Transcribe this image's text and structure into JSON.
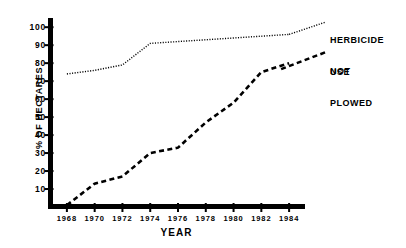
{
  "chart_data": {
    "type": "line",
    "title": "",
    "xlabel": "YEAR",
    "ylabel": "% OF HECTARES",
    "xlim": [
      1967,
      1985
    ],
    "ylim": [
      0,
      104
    ],
    "grid": false,
    "legend_position": "right",
    "x": [
      1968,
      1970,
      1972,
      1974,
      1976,
      1978,
      1980,
      1982,
      1984
    ],
    "xticklabels": [
      "1968",
      "1970",
      "1972",
      "1974",
      "1976",
      "1978",
      "1980",
      "1982",
      "1984"
    ],
    "yticks": [
      10,
      20,
      30,
      40,
      50,
      60,
      70,
      80,
      90,
      100
    ],
    "yticklabels": [
      "10",
      "20",
      "30",
      "40",
      "50",
      "60",
      "70",
      "80",
      "90",
      "100"
    ],
    "series": [
      {
        "name": "HERBICIDE USE",
        "label_lines": [
          "HERBICIDE",
          "USE"
        ],
        "linestyle": "dotted",
        "color": "#000000",
        "values": [
          74,
          76,
          79,
          91,
          92,
          93,
          94,
          95,
          96
        ]
      },
      {
        "name": "NOT PLOWED",
        "label_lines": [
          "NOT",
          "PLOWED"
        ],
        "linestyle": "dashed",
        "color": "#000000",
        "values": [
          1,
          13,
          17,
          30,
          33,
          47,
          58,
          75,
          80
        ]
      }
    ]
  },
  "axes": {
    "y_axis_label": "% OF HECTARES",
    "x_axis_label": "YEAR"
  },
  "legend": {
    "herbicide_line1": "HERBICIDE",
    "herbicide_line2": "USE",
    "notplowed_line1": "NOT",
    "notplowed_line2": "PLOWED"
  }
}
